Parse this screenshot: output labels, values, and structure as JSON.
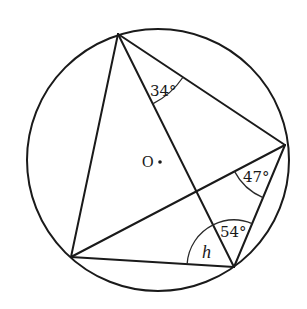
{
  "diagram": {
    "type": "circle-geometry",
    "circle": {
      "cx": 158,
      "cy": 160,
      "r": 131,
      "center_label": "O"
    },
    "points": {
      "A": {
        "x": 118,
        "y": 34
      },
      "B": {
        "x": 285,
        "y": 145
      },
      "C": {
        "x": 234,
        "y": 267
      },
      "D": {
        "x": 71,
        "y": 257
      }
    },
    "segments": [
      [
        "A",
        "B"
      ],
      [
        "A",
        "C"
      ],
      [
        "A",
        "D"
      ],
      [
        "B",
        "C"
      ],
      [
        "B",
        "D"
      ],
      [
        "D",
        "C"
      ]
    ],
    "angles": [
      {
        "id": "angle-34",
        "vertex": "A",
        "between": [
          "C",
          "B"
        ],
        "label": "34°",
        "value": 34
      },
      {
        "id": "angle-47",
        "vertex": "B",
        "between": [
          "D",
          "C"
        ],
        "label": "47°",
        "value": 47
      },
      {
        "id": "angle-54",
        "vertex": "C",
        "between": [
          "A",
          "B"
        ],
        "label": "54°",
        "value": 54
      },
      {
        "id": "angle-h",
        "vertex": "C",
        "between": [
          "D",
          "A"
        ],
        "label": "h",
        "value": null
      }
    ]
  }
}
